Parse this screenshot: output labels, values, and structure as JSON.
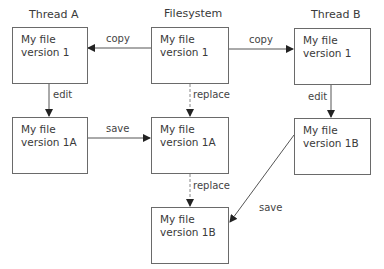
{
  "columns": {
    "thread_a": "Thread A",
    "filesystem": "Filesystem",
    "thread_b": "Thread B"
  },
  "boxes": {
    "a1": {
      "line1": "My file",
      "line2": "version 1"
    },
    "fs1": {
      "line1": "My file",
      "line2": "version 1"
    },
    "b1": {
      "line1": "My file",
      "line2": "version 1"
    },
    "a2": {
      "line1": "My file",
      "line2": "version 1A"
    },
    "fs2": {
      "line1": "My file",
      "line2": "version 1A"
    },
    "b2": {
      "line1": "My file",
      "line2": "version 1B"
    },
    "fs3": {
      "line1": "My file",
      "line2": "version 1B"
    }
  },
  "edges": {
    "copy_left": "copy",
    "copy_right": "copy",
    "edit_a": "edit",
    "edit_b": "edit",
    "replace_1": "replace",
    "replace_2": "replace",
    "save_a": "save",
    "save_b": "save"
  },
  "colors": {
    "line": "#555555",
    "dashed": "#888888",
    "border": "#6a6a6a"
  }
}
